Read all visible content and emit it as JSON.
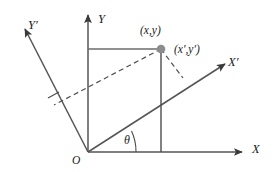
{
  "figure": {
    "type": "coordinate-rotation-diagram",
    "background_color": "#ffffff",
    "stroke_color": "#555555",
    "text_color": "#1a1a1a",
    "point_fill_color": "#8c8c8c"
  },
  "labels": {
    "axis_x": "X",
    "axis_y": "Y",
    "axis_x_prime": "X′",
    "axis_y_prime": "Y′",
    "origin": "O",
    "angle": "θ",
    "point_xy": "(x,y)",
    "point_xy_prime": "(x′,y′)"
  },
  "geometry": {
    "origin": {
      "x": 88,
      "y": 152
    },
    "point": {
      "x": 161,
      "y": 49
    },
    "angle_degrees": 26,
    "x_axis_end": {
      "x": 245,
      "y": 152
    },
    "y_axis_end": {
      "x": 88,
      "y": 12
    },
    "x_prime_axis_end": {
      "x": 228,
      "y": 62
    },
    "y_prime_axis_end": {
      "x": 22,
      "y": 26
    },
    "projection_on_x_prime": {
      "x": 183,
      "y": 78
    },
    "projection_on_y_prime": {
      "x": 54,
      "y": 105
    }
  }
}
